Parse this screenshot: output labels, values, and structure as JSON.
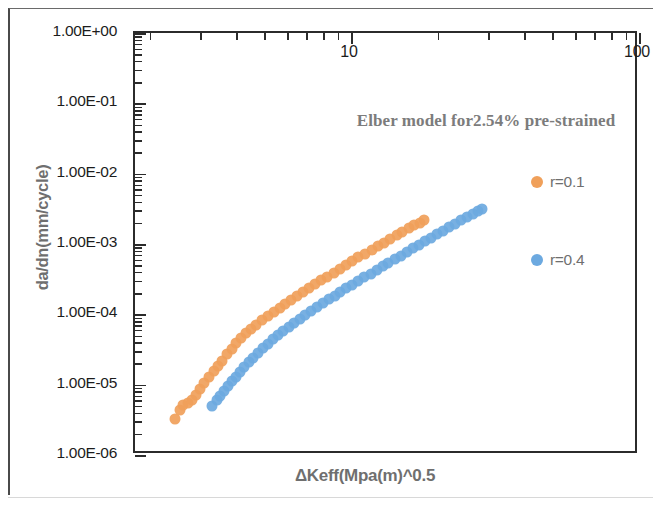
{
  "chart_data": {
    "type": "scatter",
    "title": "Elber model for2.54% pre-strained",
    "xlabel": "ΔKeff(Mpa(m)^0.5",
    "ylabel": "da/dn(mm/cycle)",
    "xscale": "log",
    "yscale": "log",
    "xlim": [
      1.78,
      100
    ],
    "ylim": [
      1e-06,
      1
    ],
    "grid": false,
    "x_axis_position": "top",
    "x_ticklabels": [
      "10",
      "100"
    ],
    "x_tickvalues": [
      10,
      100
    ],
    "y_ticklabels": [
      "1.00E+00",
      "1.00E-01",
      "1.00E-02",
      "1.00E-03",
      "1.00E-04",
      "1.00E-05",
      "1.00E-06"
    ],
    "y_tickvalues": [
      1,
      0.1,
      0.01,
      0.001,
      0.0001,
      1e-05,
      1e-06
    ],
    "legend_position": "right-inside",
    "series": [
      {
        "name": "r=0.1",
        "color": "#F0A05A",
        "marker": "circle",
        "points": [
          [
            2.46,
            3.3e-06
          ],
          [
            2.55,
            4.3e-06
          ],
          [
            2.62,
            5.1e-06
          ],
          [
            2.72,
            5.4e-06
          ],
          [
            2.8,
            6e-06
          ],
          [
            2.9,
            7.2e-06
          ],
          [
            3.0,
            8.6e-06
          ],
          [
            3.1,
            1.05e-05
          ],
          [
            3.22,
            1.3e-05
          ],
          [
            3.34,
            1.55e-05
          ],
          [
            3.46,
            1.85e-05
          ],
          [
            3.58,
            2.2e-05
          ],
          [
            3.72,
            2.7e-05
          ],
          [
            3.86,
            3.25e-05
          ],
          [
            4.0,
            3.9e-05
          ],
          [
            4.15,
            4.6e-05
          ],
          [
            4.32,
            5.4e-05
          ],
          [
            4.5,
            6.2e-05
          ],
          [
            4.7,
            7.1e-05
          ],
          [
            4.92,
            8.2e-05
          ],
          [
            5.15,
            9.4e-05
          ],
          [
            5.4,
            0.000108
          ],
          [
            5.65,
            0.000123
          ],
          [
            5.92,
            0.00014
          ],
          [
            6.2,
            0.00016
          ],
          [
            6.5,
            0.000182
          ],
          [
            6.82,
            0.000208
          ],
          [
            7.15,
            0.000236
          ],
          [
            7.5,
            0.000268
          ],
          [
            7.88,
            0.000305
          ],
          [
            8.28,
            0.000345
          ],
          [
            8.7,
            0.000392
          ],
          [
            9.15,
            0.000445
          ],
          [
            9.62,
            0.000505
          ],
          [
            10.1,
            0.00057
          ],
          [
            10.6,
            0.000645
          ],
          [
            11.2,
            0.00073
          ],
          [
            11.8,
            0.000825
          ],
          [
            12.4,
            0.00093
          ],
          [
            13.0,
            0.00105
          ],
          [
            13.7,
            0.00118
          ],
          [
            14.4,
            0.00133
          ],
          [
            15.1,
            0.00149
          ],
          [
            15.9,
            0.00167
          ],
          [
            16.6,
            0.00185
          ],
          [
            17.3,
            0.00202
          ],
          [
            17.9,
            0.00218
          ]
        ]
      },
      {
        "name": "r=0.4",
        "color": "#6CA9E0",
        "marker": "circle",
        "points": [
          [
            3.3,
            5e-06
          ],
          [
            3.42,
            6e-06
          ],
          [
            3.52,
            7e-06
          ],
          [
            3.62,
            8.2e-06
          ],
          [
            3.74,
            9.6e-06
          ],
          [
            3.86,
            1.12e-05
          ],
          [
            3.98,
            1.3e-05
          ],
          [
            4.12,
            1.52e-05
          ],
          [
            4.26,
            1.78e-05
          ],
          [
            4.42,
            2.08e-05
          ],
          [
            4.58,
            2.42e-05
          ],
          [
            4.76,
            2.82e-05
          ],
          [
            4.95,
            3.28e-05
          ],
          [
            5.15,
            3.8e-05
          ],
          [
            5.36,
            4.4e-05
          ],
          [
            5.58,
            5.05e-05
          ],
          [
            5.82,
            5.8e-05
          ],
          [
            6.08,
            6.65e-05
          ],
          [
            6.35,
            7.6e-05
          ],
          [
            6.64,
            8.65e-05
          ],
          [
            6.95,
            9.85e-05
          ],
          [
            7.28,
            0.000112
          ],
          [
            7.62,
            0.000127
          ],
          [
            7.98,
            0.000144
          ],
          [
            8.36,
            0.000163
          ],
          [
            8.78,
            0.000184
          ],
          [
            9.2,
            0.000208
          ],
          [
            9.65,
            0.000235
          ],
          [
            10.1,
            0.000265
          ],
          [
            10.6,
            0.000299
          ],
          [
            11.1,
            0.000337
          ],
          [
            11.7,
            0.00038
          ],
          [
            12.3,
            0.000428
          ],
          [
            12.9,
            0.000482
          ],
          [
            13.5,
            0.000542
          ],
          [
            14.2,
            0.00061
          ],
          [
            14.9,
            0.000686
          ],
          [
            15.6,
            0.00077
          ],
          [
            16.4,
            0.000865
          ],
          [
            17.2,
            0.00097
          ],
          [
            18.1,
            0.00109
          ],
          [
            19.0,
            0.00122
          ],
          [
            19.9,
            0.00137
          ],
          [
            20.9,
            0.00153
          ],
          [
            21.9,
            0.00172
          ],
          [
            23.0,
            0.00193
          ],
          [
            24.1,
            0.00216
          ],
          [
            25.3,
            0.00242
          ],
          [
            26.5,
            0.0027
          ],
          [
            27.6,
            0.00295
          ],
          [
            28.4,
            0.00315
          ]
        ]
      }
    ]
  },
  "legend": {
    "items": [
      {
        "label": "r=0.1",
        "color": "#F0A05A"
      },
      {
        "label": "r=0.4",
        "color": "#6CA9E0"
      }
    ]
  }
}
